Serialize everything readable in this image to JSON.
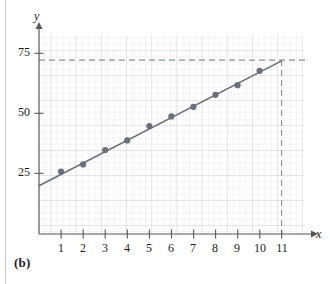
{
  "figure": {
    "panel_label": "(b)",
    "x_axis_letter": "x",
    "y_axis_letter": "y"
  },
  "chart_data": {
    "type": "scatter",
    "title": "",
    "subtitle": "",
    "xlabel": "x",
    "ylabel": "y",
    "x": [
      1,
      2,
      3,
      4,
      5,
      6,
      7,
      8,
      9,
      10
    ],
    "values": [
      26,
      29,
      35,
      39,
      45,
      49,
      53,
      58,
      62,
      68
    ],
    "series": [
      {
        "name": "data points",
        "x": [
          1,
          2,
          3,
          4,
          5,
          6,
          7,
          8,
          9,
          10
        ],
        "values": [
          26,
          29,
          35,
          39,
          45,
          49,
          53,
          58,
          62,
          68
        ],
        "marker": "filled-circle",
        "color": "#6b6f7a"
      },
      {
        "name": "least squares line",
        "type": "line",
        "x": [
          0,
          11
        ],
        "values": [
          20.5,
          72.5
        ],
        "color": "#6b6f7a"
      }
    ],
    "xlim": [
      0,
      11.6
    ],
    "ylim": [
      0,
      82
    ],
    "xticks": [
      1,
      2,
      3,
      4,
      5,
      6,
      7,
      8,
      9,
      10,
      11
    ],
    "xtick_labels": [
      "1",
      "2",
      "3",
      "4",
      "5",
      "6",
      "7",
      "8",
      "9",
      "10",
      "11"
    ],
    "yticks": [
      25,
      50,
      75
    ],
    "ytick_labels": [
      "25",
      "50",
      "75"
    ],
    "grid": true,
    "grid_color": "#dcd2d4",
    "grid_major_color": "#c3c6cf",
    "legend": "none",
    "annotations": [
      {
        "name": "horizontal-reference-line",
        "style": "dashed",
        "y": 72.5,
        "from_x": 0,
        "to_x": 11.4,
        "color": "#8b8f98"
      },
      {
        "name": "vertical-reference-line",
        "style": "dashed",
        "x": 11,
        "from_y": 0,
        "to_y": 72.5,
        "color": "#8b8f98"
      }
    ],
    "axis_arrow_x": true,
    "axis_arrow_y": true
  },
  "colors": {
    "axis": "#57575a",
    "data": "#6b6f7a",
    "dashed": "#8b8f98",
    "grid_minor": "#e2d8da",
    "grid_major": "#c5c8d0",
    "text": "#1b1b1b",
    "page_rule": "#c9c9c9"
  }
}
